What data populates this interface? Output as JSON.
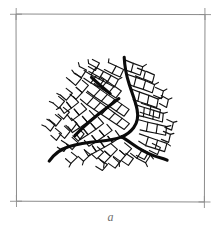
{
  "figure": {
    "panel_label": "a",
    "canvas": {
      "width": 221,
      "height": 235
    },
    "colors": {
      "background": "#ffffff",
      "frame_stroke": "#8c8c8c",
      "cell_stroke": "#121212",
      "main_crack_stroke": "#0b0b0b",
      "caption_text": "#6e6e6e"
    },
    "stroke_widths": {
      "frame": 1.0,
      "cell": 1.15,
      "main_crack": 3.1
    },
    "frame": {
      "name": "plot-frame",
      "x": 16,
      "y": 14,
      "width": 189,
      "height": 188,
      "corner_tick_overshoot": 6
    },
    "pattern": {
      "center": {
        "x": 122,
        "y": 132
      },
      "bounds": {
        "x": 48,
        "y": 56,
        "width": 122,
        "height": 110
      },
      "cell_count": 96,
      "main_branch_count": 3,
      "main_branches": [
        {
          "name": "branch-north",
          "endpoint": {
            "x": 124,
            "y": 57
          }
        },
        {
          "name": "branch-west",
          "endpoint": {
            "x": 49,
            "y": 161
          }
        },
        {
          "name": "branch-southeast",
          "endpoint": {
            "x": 167,
            "y": 160
          }
        }
      ]
    },
    "geometry": {
      "frame_path": "M 16 14 L 205 14.6 L 204.4 202 L 16.5 201.2 Z",
      "corner_ticks": [
        "M 10 14.3 L 22 14.2",
        "M 16.2 8 L 16.1 20",
        "M 199 14.5 L 211 14.6",
        "M 204.9 8 L 205 20",
        "M 10 201.3 L 22 201.2",
        "M 16.4 195 L 16.5 207",
        "M 198.5 201.9 L 210.5 202",
        "M 204.4 196 L 204.4 208"
      ],
      "main_cracks": [
        "M 124.2 57.2 C 124.6 66 126.4 75.6 129.3 84.6 C 132.3 93.9 135.6 101.9 137.1 109.6 C 138.5 116.8 137.3 122.9 133.6 127.8 C 130.1 132.4 125.9 135.2 121.6 136.9",
        "M 121.6 136.9 C 115.2 139.5 107.6 140.6 99.4 141.3 C 88.6 142.2 77.4 143.9 68.4 146.8 C 61.4 149 54.9 153.1 49.2 161.1",
        "M 121.6 136.9 C 126.9 139.9 131.9 143.8 137.6 147.5 C 145.3 152.5 152.9 155.8 160.2 157.8 C 163.1 158.6 165.3 159.3 167.1 160.2",
        "M 118.9 98.6 C 112.6 103.4 105.4 108.7 97.8 114.8 C 89.9 121.2 81.3 128.9 74.9 135.6",
        "M 91.5 77.4 C 97.2 82.9 103.6 88.4 110.2 93.6"
      ],
      "cell_edges": [
        "M 124.2 59.6 L 133.3 63.4 L 131.1 71.9 L 126.2 70.4",
        "M 133.3 63.4 L 142.7 66.8 L 140.2 75.2 L 131.1 71.9",
        "M 126.9 74.2 L 136.1 77.4 L 133.8 86.4 L 129.1 84.2",
        "M 136.1 77.4 L 145.6 80.7 L 143.2 89.4 L 133.8 86.4",
        "M 145.6 80.7 L 154.6 84.6 L 152.2 92.8 L 143.2 89.4",
        "M 130.6 88.8 L 139.6 92.1 L 137.9 101.2 L 133.2 99.6",
        "M 139.6 92.1 L 148.9 95.4 L 147.2 104.2 L 137.9 101.2",
        "M 148.9 95.4 L 158.2 99.1 L 156.6 107.6 L 147.2 104.2",
        "M 135.1 104.6 L 144.3 107.5 L 143.4 116.6 L 138.2 115.6",
        "M 144.3 107.5 L 153.8 110.4 L 152.9 119.2 L 143.4 116.6",
        "M 153.8 110.4 L 163.3 113.4 L 162.4 122 L 152.9 119.2",
        "M 138.8 119.8 L 147.9 122.2 L 146.4 131.4 L 140.1 129.9",
        "M 147.9 122.2 L 157.4 124.4 L 156.2 133.2 L 146.4 131.4",
        "M 157.4 124.4 L 166.6 126.6 L 165.6 135.2 L 156.2 133.2",
        "M 139.4 133.9 L 148.3 137 L 145.6 145.6 L 138.8 141.2",
        "M 148.3 137 L 157.6 140.2 L 155.2 148.6 L 145.6 145.6",
        "M 157.6 140.2 L 166.9 143.4 L 164.6 151.6 L 155.2 148.6",
        "M 133.9 145.6 L 141.9 150.4 L 136.9 158.2 L 130.6 153.4",
        "M 141.9 150.4 L 150.4 155.2 L 145.6 162.8 L 136.9 158.2",
        "M 124.6 142.9 L 131.6 148.6 L 125.4 155.4 L 119.6 150.4",
        "M 119.6 150.4 L 125.4 155.4 L 119.2 162.6 L 113.4 157.4",
        "M 111.2 143.9 L 117.4 149.4 L 110.6 156.4 L 104.8 151.2",
        "M 104.8 151.2 L 110.6 156.4 L 104.2 163.2 L 98.6 158.2",
        "M 97.4 146.9 L 103.6 152.2 L 96.8 158.9 L 91.2 153.9",
        "M 84.2 149.6 L 90.4 154.6 L 83.6 161.2 L 78.1 156.4",
        "M 71.4 152.4 L 77.4 157.1 L 70.9 163.4 L 65.6 158.7",
        "M 115.4 130.6 L 120.2 137.2 L 112.4 142.4 L 107.9 136.4",
        "M 107.9 136.4 L 112.4 142.4 L 104.4 147.2 L 100.1 141.4",
        "M 100.1 141.4 L 104.4 147.2 L 96.4 151.6 L 92.4 145.9",
        "M 92.4 145.9 L 96.4 151.6 L 88.4 155.9 L 84.6 150.2",
        "M 106.9 124.4 L 112.1 130.4 L 104.4 136.1 L 99.4 130.4",
        "M 99.4 130.4 L 104.4 136.1 L 96.6 141.4 L 91.9 135.6",
        "M 91.9 135.6 L 96.6 141.4 L 88.8 146.2 L 84.4 140.4",
        "M 98.2 117.4 L 103.6 123.4 L 95.9 129.2 L 90.9 123.4",
        "M 90.9 123.4 L 95.9 129.2 L 88.1 134.6 L 83.4 128.8",
        "M 83.4 128.8 L 88.1 134.6 L 80.4 139.6 L 76.1 133.8",
        "M 89.4 110.6 L 94.9 116.4 L 87.4 122.2 L 82.4 116.4",
        "M 82.4 116.4 L 87.4 122.2 L 79.9 127.6 L 75.2 121.8",
        "M 75.2 121.8 L 79.9 127.6 L 72.4 132.6 L 68.1 126.9",
        "M 81.2 103.4 L 86.6 109.2 L 79.2 115.1 L 74.2 109.2",
        "M 74.2 109.2 L 79.2 115.1 L 71.9 120.6 L 67.1 114.6",
        "M 73.4 96.6 L 78.6 102.4 L 71.4 108.1 L 66.6 102.2",
        "M 66.6 102.2 L 71.4 108.1 L 64.2 113.4 L 59.9 107.4",
        "M 86.4 92.4 L 93.4 97.4 L 86.9 104.6 L 80.4 99.2",
        "M 93.4 97.4 L 100.4 102.6 L 94.1 109.4 L 86.9 104.6",
        "M 100.4 102.6 L 107.6 107.9 L 101.6 114.4 L 94.1 109.4",
        "M 107.6 107.9 L 114.9 113.2 L 109.1 119.4 L 101.6 114.4",
        "M 114.9 113.2 L 122.2 118.4 L 116.6 124.4 L 109.1 119.4",
        "M 122.2 118.4 L 129.4 123.6 L 124.2 129.4 L 116.6 124.4",
        "M 93.4 84.4 L 100.2 89.4 L 93.9 96.2 L 87.4 91.2",
        "M 100.2 89.4 L 107.4 94.4 L 101.4 101.2 L 93.9 96.2",
        "M 107.4 94.4 L 114.6 99.4 L 108.9 106.1 L 101.4 101.2",
        "M 114.6 99.4 L 121.9 104.4 L 116.4 111.2 L 108.9 106.1",
        "M 121.9 104.4 L 129.1 109.4 L 124.1 116.2 L 116.4 111.2",
        "M 100.4 76.4 L 107.2 81.2 L 101.1 88.4 L 94.4 83.4",
        "M 107.2 81.2 L 114.2 86.1 L 108.4 93.1 L 101.1 88.4",
        "M 114.2 86.1 L 121.4 90.9 L 115.9 97.9 L 108.4 93.1",
        "M 88.9 71.4 L 96.4 75.6 L 90.9 82.9 L 83.9 78.2",
        "M 96.4 75.6 L 103.9 79.9 L 98.6 87.1 L 90.9 82.9",
        "M 82.4 80.4 L 88.4 85.4 L 82.2 92.6 L 76.2 87.4",
        "M 76.2 87.4 L 82.2 92.6 L 75.9 99.4 L 70.1 94.2",
        "M 75.4 73.4 L 81.6 78.2 L 75.6 85.4 L 69.6 80.2",
        "M 66.2 88.4 L 72.4 93.2 L 66.4 100.2 L 60.6 95.2",
        "M 58.6 96.4 L 64.6 101.2 L 58.9 108.1 L 53.2 103.1",
        "M 63.4 107.4 L 69.4 112.2 L 63.6 119.2 L 58.1 114.1",
        "M 55.4 114.6 L 61.4 119.2 L 55.9 126.2 L 50.4 121.2",
        "M 71.2 118.1 L 76.9 123.4 L 71.4 130.6 L 65.9 125.4",
        "M 64.4 126.2 L 70.1 131.4 L 64.6 138.4 L 59.1 133.4",
        "M 78.4 128.4 L 84.1 133.9 L 78.4 141.2 L 72.9 135.9",
        "M 72.1 137.4 L 77.9 142.6 L 72.2 149.6 L 66.6 144.4",
        "M 88.6 63.4 L 96.1 67.4 L 91.2 74.9 L 84.1 70.4",
        "M 96.1 67.4 L 103.6 71.4 L 99.1 78.9 L 91.2 74.9",
        "M 103.6 71.4 L 111.1 75.4 L 106.9 82.9 L 99.1 78.9",
        "M 111.1 75.4 L 118.4 79.4 L 114.4 86.9 L 106.9 82.9",
        "M 79.4 66.4 L 86.4 70.1 L 81.4 77.6 L 74.4 73.4",
        "M 108.4 62.6 L 116.1 66.1 L 112.1 73.4 L 104.4 69.6",
        "M 116.1 66.1 L 123.6 69.6 L 120.1 77.1 L 112.1 73.4",
        "M 141.4 103.2 L 150.9 106.4 L 149.4 115.2 L 140.1 112.2",
        "M 150.9 106.4 L 160.4 109.6 L 159.1 118.2 L 149.4 115.2",
        "M 161.2 95.6 L 168.4 99.4 L 166.6 107.4 L 159.4 103.6",
        "M 155.6 87.4 L 163.4 90.9 L 161.4 98.6 L 153.6 95.2",
        "M 146.4 71.4 L 154.4 74.9 L 152.4 82.6 L 144.4 79.2",
        "M 137.4 68.1 L 145.4 71.4 L 143.4 79.2 L 135.4 75.9",
        "M 125.9 153.4 L 133.4 158.4 L 128.4 165.4 L 121.4 160.6",
        "M 113.4 156.4 L 120.4 161.4 L 115.1 168.1 L 108.4 163.4",
        "M 100.4 160.1 L 107.4 164.6 L 102.4 170.4 L 95.9 166.4",
        "M 140.4 148.4 L 148.4 152.4 L 144.4 159.4 L 136.4 155.4",
        "M 152.4 143.4 L 160.4 147.4 L 157.4 154.6 L 149.4 150.4",
        "M 163.4 131.4 L 170.4 134.4 L 168.6 142.4 L 161.4 139.4",
        "M 166.9 119.4 L 173.4 122.4 L 171.6 130.1 L 164.9 127.4",
        "M 61.4 140.4 L 68.4 144.9 L 63.9 151.4 L 57.4 147.2",
        "M 55.4 128.4 L 61.4 133.4 L 56.4 140.4 L 50.9 135.4",
        "M 48.9 119.4 L 55.1 124.4 L 50.4 131.1 L 45.4 126.4",
        "M 92.4 59.4 L 99.4 63.1 L 95.4 70.4 L 88.4 66.6"
      ],
      "cell_tick_marks": [
        "M 124.2 57.2 L 124.6 61.4",
        "M 142.7 66.8 L 146.4 64.4",
        "M 154.6 84.6 L 158.4 82.4",
        "M 158.2 99.1 L 162.4 97.4",
        "M 163.3 113.4 L 167.4 112.2",
        "M 166.6 126.6 L 170.9 125.6",
        "M 166.9 143.4 L 170.4 145.9",
        "M 150.4 155.2 L 153.4 158.9",
        "M 145.6 162.8 L 147.4 166.6",
        "M 119.2 162.6 L 119.4 166.4",
        "M 104.2 163.2 L 103.6 167.4",
        "M 83.6 161.2 L 82.4 164.9",
        "M 70.9 163.4 L 69.1 166.9",
        "M 50.4 121.2 L 46.9 119.2",
        "M 53.2 103.1 L 49.4 101.4",
        "M 59.9 107.4 L 56.4 109.4",
        "M 60.6 95.2 L 56.9 93.4",
        "M 69.6 80.2 L 66.4 77.6",
        "M 74.4 73.4 L 71.9 70.1",
        "M 79.4 66.4 L 78.4 62.6",
        "M 88.6 63.4 L 88.1 59.6",
        "M 108.4 62.6 L 108.9 58.9",
        "M 118.4 79.4 L 121.9 77.4",
        "M 168.4 99.4 L 171.9 97.9",
        "M 173.4 122.4 L 176.9 121.4",
        "M 170.4 134.4 L 173.9 133.4",
        "M 45.4 126.4 L 41.9 124.9",
        "M 163.4 90.9 L 166.9 89.1"
      ]
    }
  }
}
